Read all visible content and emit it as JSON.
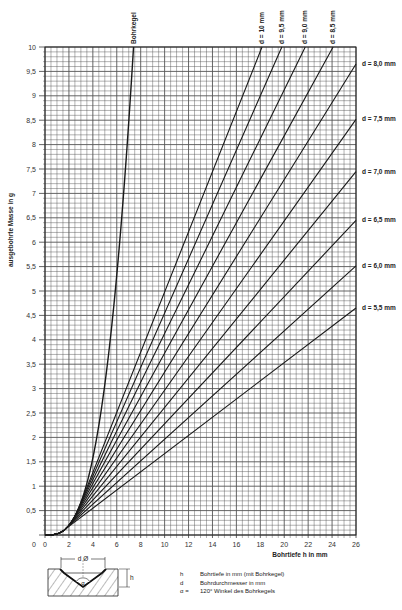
{
  "chart_data": {
    "type": "line",
    "title": "",
    "xlabel": "Bohrtiefe h in mm",
    "ylabel": "ausgebohrte Masse in g",
    "xlim": [
      0,
      26
    ],
    "ylim": [
      0,
      10
    ],
    "grid": true,
    "x_ticks": [
      "0",
      "2",
      "4",
      "6",
      "8",
      "10",
      "12",
      "14",
      "16",
      "18",
      "20",
      "22",
      "24",
      "26"
    ],
    "y_ticks": [
      "0,5",
      "1",
      "1,5",
      "2",
      "2,5",
      "3",
      "3,5",
      "4",
      "4,5",
      "5",
      "5,5",
      "6",
      "6,5",
      "7",
      "7,5",
      "8",
      "8,5",
      "9",
      "9,5",
      "10"
    ],
    "series": [
      {
        "name": "Bohrkegel",
        "points": [
          [
            0,
            0
          ],
          [
            2,
            0.2
          ],
          [
            3,
            0.67
          ],
          [
            4,
            1.58
          ],
          [
            5,
            3.08
          ],
          [
            6,
            5.33
          ],
          [
            7,
            8.46
          ],
          [
            7.4,
            10
          ]
        ]
      },
      {
        "name": "d = 10 mm",
        "d": 10,
        "points": [
          [
            2.89,
            0.59
          ],
          [
            6,
            2.5
          ],
          [
            10,
            4.95
          ],
          [
            14,
            7.41
          ],
          [
            18.3,
            10
          ]
        ]
      },
      {
        "name": "d = 9,5 mm",
        "d": 9.5,
        "points": [
          [
            2.74,
            0.51
          ],
          [
            6,
            2.39
          ],
          [
            10,
            4.58
          ],
          [
            14,
            6.81
          ],
          [
            19.9,
            10
          ]
        ]
      },
      {
        "name": "d = 9,0 mm",
        "d": 9.0,
        "points": [
          [
            2.6,
            0.44
          ],
          [
            6,
            2.25
          ],
          [
            10,
            4.24
          ],
          [
            16,
            7.24
          ],
          [
            21.9,
            10
          ]
        ]
      },
      {
        "name": "d = 8,5 mm",
        "d": 8.5,
        "points": [
          [
            2.45,
            0.37
          ],
          [
            6,
            2.1
          ],
          [
            10,
            3.89
          ],
          [
            16,
            6.56
          ],
          [
            24.2,
            10
          ]
        ]
      },
      {
        "name": "d = 8,0 mm",
        "d": 8.0,
        "points": [
          [
            2.31,
            0.3
          ],
          [
            6,
            1.94
          ],
          [
            10,
            3.52
          ],
          [
            18,
            6.68
          ],
          [
            26,
            9.65
          ]
        ]
      },
      {
        "name": "d = 7,5 mm",
        "d": 7.5,
        "points": [
          [
            2.17,
            0.25
          ],
          [
            6,
            1.78
          ],
          [
            10,
            3.17
          ],
          [
            18,
            5.95
          ],
          [
            26,
            8.5
          ]
        ]
      },
      {
        "name": "d = 7,0 mm",
        "d": 7.0,
        "points": [
          [
            2.02,
            0.2
          ],
          [
            6,
            1.61
          ],
          [
            10,
            2.82
          ],
          [
            18,
            5.24
          ],
          [
            26,
            7.4
          ]
        ]
      },
      {
        "name": "d = 6,5 mm",
        "d": 6.5,
        "points": [
          [
            1.88,
            0.16
          ],
          [
            6,
            1.45
          ],
          [
            10,
            2.49
          ],
          [
            18,
            4.57
          ],
          [
            26,
            6.4
          ]
        ]
      },
      {
        "name": "d = 6,0 mm",
        "d": 6.0,
        "points": [
          [
            1.73,
            0.13
          ],
          [
            6,
            1.29
          ],
          [
            10,
            2.17
          ],
          [
            18,
            3.95
          ],
          [
            26,
            5.6
          ]
        ]
      },
      {
        "name": "d = 5,5 mm",
        "d": 5.5,
        "points": [
          [
            1.59,
            0.1
          ],
          [
            6,
            1.12
          ],
          [
            10,
            1.87
          ],
          [
            18,
            3.36
          ],
          [
            26,
            4.65
          ]
        ]
      }
    ],
    "annotations": [
      "Bohrkegel",
      "d = 10 mm",
      "d = 9,5 mm",
      "d = 9,0 mm",
      "d = 8,5 mm",
      "d = 8,0 mm",
      "d = 7,5 mm",
      "d = 7,0 mm",
      "d = 6,5 mm",
      "d = 6,0 mm",
      "d = 5,5 mm"
    ]
  },
  "axes": {
    "x_label": "Bohrtiefe h in mm",
    "y_label": "ausgebohrte Masse in g",
    "origin_label": "0"
  },
  "curve_labels": {
    "cone": "Bohrkegel",
    "top": [
      "d = 10 mm",
      "d = 9,5 mm",
      "d = 9,0 mm",
      "d = 8,5 mm"
    ],
    "right": [
      "d = 8,0 mm",
      "d = 7,5 mm",
      "d = 7,0 mm",
      "d = 6,5 mm",
      "d = 6,0 mm",
      "d = 5,5 mm"
    ]
  },
  "diagram": {
    "d_label": "d Ø",
    "h_label": "h",
    "alpha_label": "α"
  },
  "legend": [
    {
      "key": "h",
      "text": "Bohrtiefe in mm (mit Bohrkegel)"
    },
    {
      "key": "d",
      "text": "Bohrdurchmesser in mm"
    },
    {
      "key": "α =",
      "text": "120° Winkel des Bohrkegels"
    }
  ],
  "colors": {
    "grid": "#555555",
    "curve": "#1a1a1a",
    "background": "#ffffff"
  }
}
